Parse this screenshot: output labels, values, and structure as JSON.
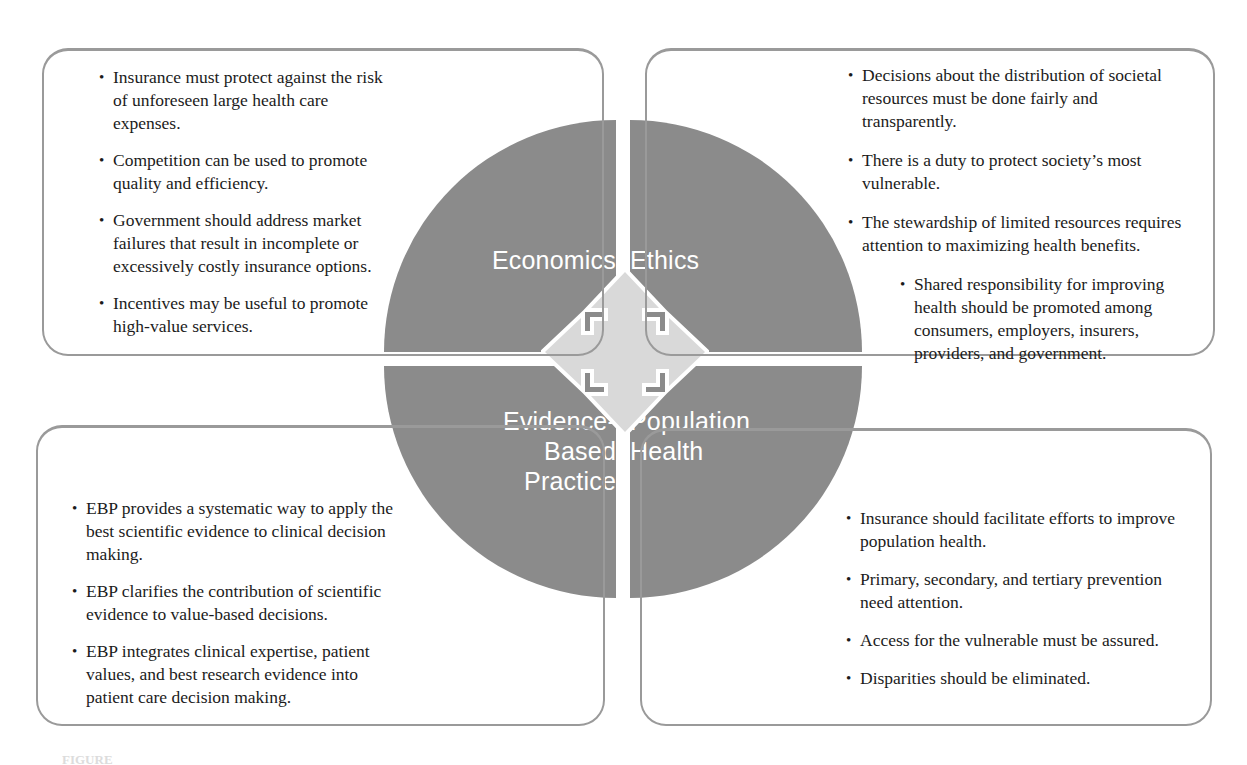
{
  "figure": {
    "circle_color": "#8b8b8b",
    "label_color": "#ffffff",
    "panel_border_color": "#9a9a9a",
    "arrow_fill": "#d9d9d9",
    "arrow_outline": "#ffffff",
    "center_icon_name": "four-way-arrow-icon"
  },
  "quadrants": {
    "economics": {
      "label": "Economics",
      "bullets": [
        {
          "text": "Insurance must protect against the risk of unforeseen large health care expenses.",
          "indent": false
        },
        {
          "text": "Competition can be used to promote quality and efficiency.",
          "indent": false
        },
        {
          "text": "Government should address market failures that result in incomplete or excessively costly insurance options.",
          "indent": false
        },
        {
          "text": "Incentives may be useful to promote high-value services.",
          "indent": false
        }
      ]
    },
    "ethics": {
      "label": "Ethics",
      "bullets": [
        {
          "text": "Decisions about the distribution of societal resources must be done fairly and transparently.",
          "indent": false
        },
        {
          "text": "There is a duty to protect society’s most vulnerable.",
          "indent": false
        },
        {
          "text": "The stewardship of limited resources requires attention to maximizing health benefits.",
          "indent": false
        },
        {
          "text": "Shared responsibility for improving health should be promoted among consumers, employers, insurers, providers, and government.",
          "indent": true
        }
      ]
    },
    "evidence_based_practice": {
      "label": "Evidence-\nBased\nPractice",
      "bullets": [
        {
          "text": "EBP provides a systematic way to apply the best scientific evidence to clinical decision making.",
          "indent": false
        },
        {
          "text": "EBP clarifies the contribution of scientific evidence to value-based decisions.",
          "indent": false
        },
        {
          "text": "EBP integrates clinical expertise, patient values, and best research evidence into patient care decision making.",
          "indent": false
        }
      ]
    },
    "population_health": {
      "label": "Population\nHealth",
      "bullets": [
        {
          "text": "Insurance should facilitate efforts to improve population health.",
          "indent": false
        },
        {
          "text": "Primary, secondary, and tertiary prevention need attention.",
          "indent": false
        },
        {
          "text": "Access for the vulnerable must be assured.",
          "indent": false
        },
        {
          "text": "Disparities should be eliminated.",
          "indent": false
        }
      ]
    }
  },
  "caption": {
    "label": "FIGURE",
    "text": ""
  }
}
